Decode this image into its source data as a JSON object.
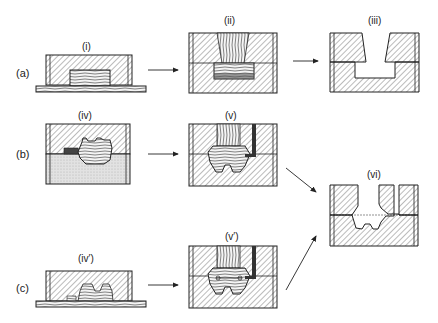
{
  "diagram": {
    "rows": [
      {
        "id": "a",
        "label": "(a)"
      },
      {
        "id": "b",
        "label": "(b)"
      },
      {
        "id": "c",
        "label": "(c)"
      }
    ],
    "panels": [
      {
        "id": "i",
        "label": "(i)"
      },
      {
        "id": "ii",
        "label": "(ii)"
      },
      {
        "id": "iii",
        "label": "(iii)"
      },
      {
        "id": "iv",
        "label": "(iv)"
      },
      {
        "id": "v",
        "label": "(v)"
      },
      {
        "id": "vi",
        "label": "(vi)"
      },
      {
        "id": "iv_prime",
        "label": "(iv′)"
      },
      {
        "id": "v_prime",
        "label": "(v′)"
      }
    ],
    "arrows": [
      {
        "from": "i",
        "to": "ii"
      },
      {
        "from": "ii",
        "to": "iii"
      },
      {
        "from": "iv",
        "to": "v"
      },
      {
        "from": "v",
        "to": "vi"
      },
      {
        "from": "iv_prime",
        "to": "v_prime"
      },
      {
        "from": "v_prime",
        "to": "vi"
      }
    ],
    "colors": {
      "stroke": "#222222",
      "hatch": "#555555",
      "stipple": "#d8d8d8",
      "background": "#ffffff"
    }
  }
}
